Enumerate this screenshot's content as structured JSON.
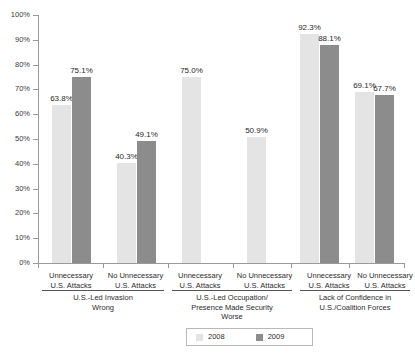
{
  "chart_data": {
    "type": "bar",
    "title": "",
    "subtitle": "",
    "xlabel": "",
    "ylabel": "",
    "ylim": [
      0,
      100
    ],
    "grid": false,
    "legend_position": "bottom",
    "y_ticks": [
      "0%",
      "10%",
      "20%",
      "30%",
      "40%",
      "50%",
      "60%",
      "70%",
      "80%",
      "90%",
      "100%"
    ],
    "y_tick_values": [
      0,
      10,
      20,
      30,
      40,
      50,
      60,
      70,
      80,
      90,
      100
    ],
    "categories": [
      "Unnecessary U.S. Attacks",
      "No Unnecessary U.S. Attacks",
      "Unnecessary U.S. Attacks",
      "No Unnecessary U.S. Attacks",
      "Unnecessary U.S. Attacks",
      "No Unnecessary U.S. Attacks"
    ],
    "category_lines": [
      [
        "Unnecessary",
        "U.S. Attacks"
      ],
      [
        "No Unnecessary",
        "U.S. Attacks"
      ],
      [
        "Unnecessary",
        "U.S. Attacks"
      ],
      [
        "No Unnecessary",
        "U.S. Attacks"
      ],
      [
        "Unnecessary",
        "U.S. Attacks"
      ],
      [
        "No Unnecessary",
        "U.S. Attacks"
      ]
    ],
    "groups": [
      {
        "label_lines": [
          "U.S.-Led Invasion",
          "Wrong"
        ],
        "categories": [
          0,
          1
        ]
      },
      {
        "label_lines": [
          "U.S.-Led Occupation/",
          "Presence Made Security",
          "Worse"
        ],
        "categories": [
          2,
          3
        ]
      },
      {
        "label_lines": [
          "Lack of Confidence in",
          "U.S./Coalition Forces"
        ],
        "categories": [
          4,
          5
        ]
      }
    ],
    "series": [
      {
        "name": "2008",
        "color": "#e4e4e4",
        "values": [
          63.8,
          40.3,
          75.0,
          50.9,
          92.3,
          69.1
        ],
        "labels": [
          "63.8%",
          "40.3%",
          "75.0%",
          "50.9%",
          "92.3%",
          "69.1%"
        ]
      },
      {
        "name": "2009",
        "color": "#8c8c8c",
        "values": [
          75.1,
          49.1,
          null,
          null,
          88.1,
          67.7
        ],
        "labels": [
          "75.1%",
          "49.1%",
          "",
          "",
          "88.1%",
          "67.7%"
        ]
      }
    ],
    "legend": [
      {
        "name": "2008",
        "color": "#e4e4e4"
      },
      {
        "name": "2009",
        "color": "#8c8c8c"
      }
    ]
  },
  "axis": {
    "y_labels": [
      "100%",
      "90%",
      "80%",
      "70%",
      "60%",
      "50%",
      "40%",
      "30%",
      "20%",
      "10%",
      "0%"
    ]
  },
  "legend": {
    "item_2008": "2008",
    "item_2009": "2009"
  },
  "footer": {
    "clipped_caption": ""
  },
  "colors": {
    "series_2008": "#e4e4e4",
    "series_2009": "#8c8c8c",
    "axis": "#9a9a9a",
    "text": "#2b2b2b",
    "background": "#ffffff"
  }
}
